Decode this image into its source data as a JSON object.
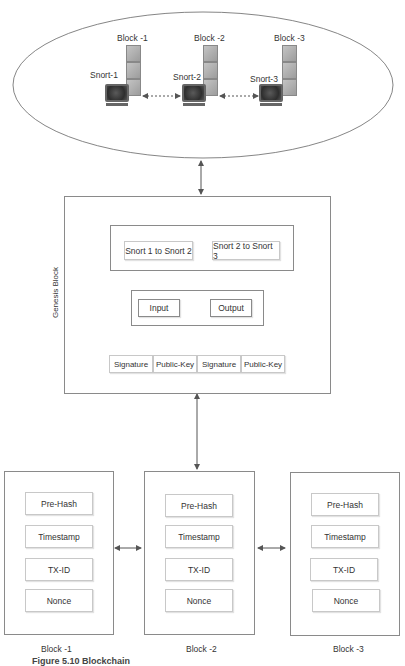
{
  "network": {
    "nodes": [
      {
        "block_label": "Block -1",
        "snort_label": "Snort-1"
      },
      {
        "block_label": "Block -2",
        "snort_label": "Snort-2"
      },
      {
        "block_label": "Block -3",
        "snort_label": "Snort-3"
      }
    ]
  },
  "genesis": {
    "side_label": "Genesis Block",
    "links": [
      "Snort 1 to Snort 2",
      "Snort 2 to Snort 3"
    ],
    "io": [
      "Input",
      "Output"
    ],
    "keys": [
      "Signature",
      "Public-Key",
      "Signature",
      "Public-Key"
    ]
  },
  "blocks": [
    {
      "label": "Block -1",
      "fields": [
        "Pre-Hash",
        "Timestamp",
        "TX-ID",
        "Nonce"
      ]
    },
    {
      "label": "Block -2",
      "fields": [
        "Pre-Hash",
        "Timestamp",
        "TX-ID",
        "Nonce"
      ]
    },
    {
      "label": "Block -3",
      "fields": [
        "Pre-Hash",
        "Timestamp",
        "TX-ID",
        "Nonce"
      ]
    }
  ],
  "caption": "Figure 5.10 Blockchain"
}
